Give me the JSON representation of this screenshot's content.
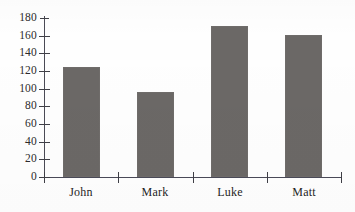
{
  "chart_data": {
    "type": "bar",
    "title": "",
    "subtitle": "",
    "xlabel": "",
    "ylabel": "",
    "categories": [
      "John",
      "Mark",
      "Luke",
      "Matt"
    ],
    "values": [
      124,
      96,
      171,
      161
    ],
    "series": [
      {
        "name": "",
        "values": [
          124,
          96,
          171,
          161
        ]
      }
    ],
    "ylim": [
      0,
      180
    ],
    "xlim": [
      0,
      4
    ],
    "ytick_labels": [
      "0",
      "20",
      "40",
      "60",
      "80",
      "100",
      "120",
      "140",
      "160",
      "180"
    ],
    "ytick_values": [
      0,
      20,
      40,
      60,
      80,
      100,
      120,
      140,
      160,
      180
    ],
    "grid": false,
    "legend": false,
    "legend_position": "none",
    "annotations": [],
    "colors": {
      "bar_fill": "#6b6866",
      "axis": "#3f3f46",
      "text": "#1f1f1f",
      "background": "#fefefe"
    }
  }
}
